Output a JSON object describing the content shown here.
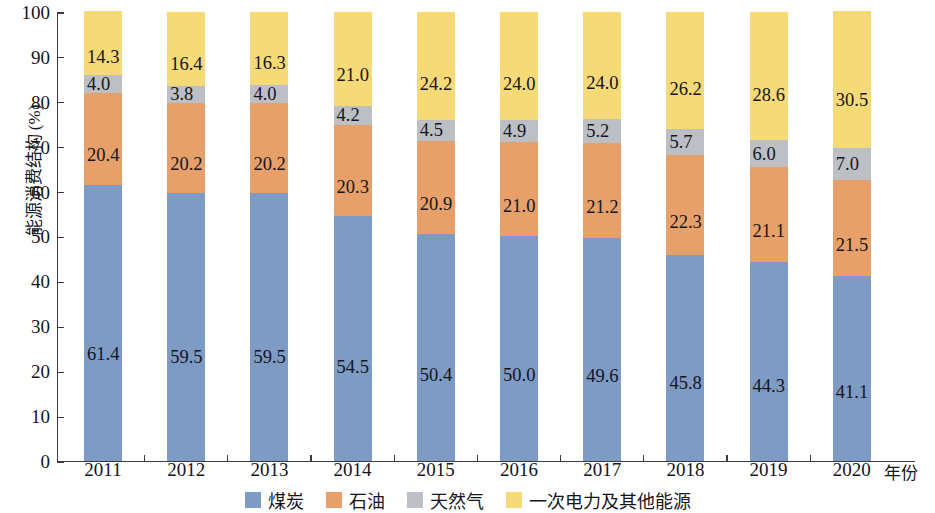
{
  "chart_data": {
    "type": "bar",
    "subtype": "stacked-100-percent",
    "title": "",
    "xlabel": "年份",
    "ylabel": "能源消费结构 (%)",
    "ylim": [
      0,
      100
    ],
    "yticks": [
      0,
      10,
      20,
      30,
      40,
      50,
      60,
      70,
      80,
      90,
      100
    ],
    "ytick_labels": [
      "0",
      "10",
      "20",
      "30",
      "40",
      "50",
      "60",
      "70",
      "80",
      "90",
      "100"
    ],
    "grid": false,
    "legend_position": "bottom",
    "categories": [
      "2011",
      "2012",
      "2013",
      "2014",
      "2015",
      "2016",
      "2017",
      "2018",
      "2019",
      "2020"
    ],
    "series": [
      {
        "name": "煤炭",
        "color": "#7e9bc6",
        "values": [
          61.4,
          59.5,
          59.5,
          54.5,
          50.4,
          50.0,
          49.6,
          45.8,
          44.3,
          41.1
        ],
        "labels": [
          "61.4",
          "59.5",
          "59.5",
          "54.5",
          "50.4",
          "50.0",
          "49.6",
          "45.8",
          "44.3",
          "41.1"
        ]
      },
      {
        "name": "石油",
        "color": "#e8a06a",
        "values": [
          20.4,
          20.2,
          20.2,
          20.3,
          20.9,
          21.0,
          21.2,
          22.3,
          21.1,
          21.5
        ],
        "labels": [
          "20.4",
          "20.2",
          "20.2",
          "20.3",
          "20.9",
          "21.0",
          "21.2",
          "22.3",
          "21.1",
          "21.5"
        ]
      },
      {
        "name": "天然气",
        "color": "#bcc0c4",
        "values": [
          4.0,
          3.8,
          4.0,
          4.2,
          4.5,
          4.9,
          5.2,
          5.7,
          6.0,
          7.0
        ],
        "labels": [
          "4.0",
          "3.8",
          "4.0",
          "4.2",
          "4.5",
          "4.9",
          "5.2",
          "5.7",
          "6.0",
          "7.0"
        ]
      },
      {
        "name": "一次电力及其他能源",
        "color": "#f7da78",
        "values": [
          14.3,
          16.4,
          16.3,
          21.0,
          24.2,
          24.0,
          24.0,
          26.2,
          28.6,
          30.5
        ],
        "labels": [
          "14.3",
          "16.4",
          "16.3",
          "21.0",
          "24.2",
          "24.0",
          "24.0",
          "26.2",
          "28.6",
          "30.5"
        ]
      }
    ]
  },
  "legend": {
    "items": [
      {
        "label": "煤炭",
        "color": "#7e9bc6"
      },
      {
        "label": "石油",
        "color": "#e8a06a"
      },
      {
        "label": "天然气",
        "color": "#bcc0c4"
      },
      {
        "label": "一次电力及其他能源",
        "color": "#f7da78"
      }
    ]
  }
}
